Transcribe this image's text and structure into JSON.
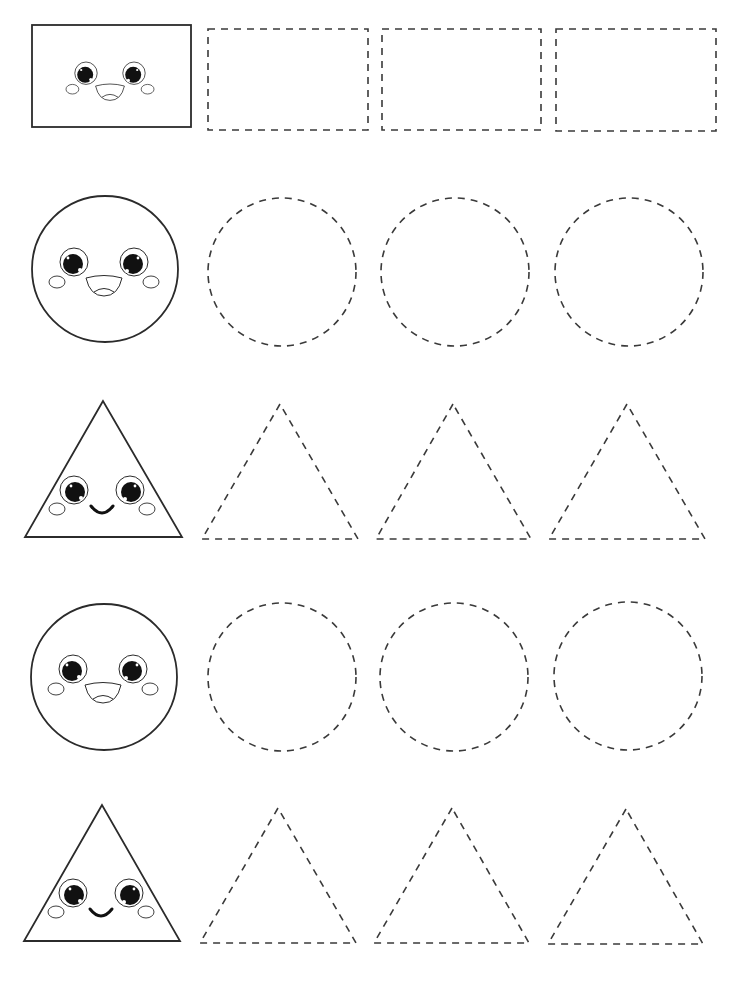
{
  "worksheet": {
    "title": "Shape tracing worksheet",
    "colors": {
      "line": "#2b2b2b",
      "dash": "#3a3a3a",
      "background": "#ffffff"
    },
    "rows": [
      {
        "shape": "rectangle",
        "face": "open-smile",
        "example": {
          "x": 32,
          "y": 25,
          "w": 159,
          "h": 102
        },
        "traces": [
          {
            "x": 208,
            "y": 29,
            "w": 160,
            "h": 101
          },
          {
            "x": 382,
            "y": 29,
            "w": 159,
            "h": 101
          },
          {
            "x": 556,
            "y": 29,
            "w": 160,
            "h": 102
          }
        ]
      },
      {
        "shape": "circle",
        "face": "open-smile",
        "example": {
          "cx": 105,
          "cy": 269,
          "r": 73
        },
        "traces": [
          {
            "cx": 282,
            "cy": 272,
            "r": 74
          },
          {
            "cx": 455,
            "cy": 272,
            "r": 74
          },
          {
            "cx": 629,
            "cy": 272,
            "r": 74
          }
        ]
      },
      {
        "shape": "triangle",
        "face": "curved-smile",
        "example": {
          "apex": [
            103,
            401
          ],
          "left": [
            25,
            537
          ],
          "right": [
            182,
            537
          ]
        },
        "traces": [
          {
            "apex": [
              280,
              404
            ],
            "left": [
              202,
              539
            ],
            "right": [
              358,
              539
            ]
          },
          {
            "apex": [
              453,
              404
            ],
            "left": [
              376,
              539
            ],
            "right": [
              531,
              539
            ]
          },
          {
            "apex": [
              627,
              404
            ],
            "left": [
              549,
              539
            ],
            "right": [
              705,
              539
            ]
          }
        ]
      },
      {
        "shape": "circle",
        "face": "open-smile",
        "example": {
          "cx": 104,
          "cy": 677,
          "r": 73
        },
        "traces": [
          {
            "cx": 282,
            "cy": 677,
            "r": 74
          },
          {
            "cx": 454,
            "cy": 677,
            "r": 74
          },
          {
            "cx": 628,
            "cy": 676,
            "r": 74
          }
        ]
      },
      {
        "shape": "triangle",
        "face": "curved-smile",
        "example": {
          "apex": [
            102,
            805
          ],
          "left": [
            24,
            941
          ],
          "right": [
            180,
            941
          ]
        },
        "traces": [
          {
            "apex": [
              278,
              808
            ],
            "left": [
              200,
              943
            ],
            "right": [
              356,
              943
            ]
          },
          {
            "apex": [
              452,
              808
            ],
            "left": [
              374,
              943
            ],
            "right": [
              529,
              943
            ]
          },
          {
            "apex": [
              626,
              809
            ],
            "left": [
              548,
              944
            ],
            "right": [
              703,
              944
            ]
          }
        ]
      }
    ]
  }
}
